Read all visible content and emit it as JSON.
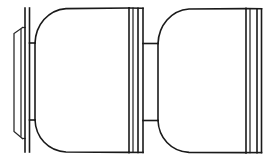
{
  "drawing": {
    "title": "Mechanical Part Outline — Side Elevation",
    "description": "Two-lobe barrel assembly with end flange, necks and banded dividers",
    "canvas": {
      "width": 266,
      "height": 160
    },
    "colors": {
      "background": "#ffffff",
      "outline": "#1a1a1a",
      "secondary_line": "#262626",
      "hairline": "#3a3a3a"
    },
    "line_style": "solid black outline on white, no fill, no shading",
    "view": "side elevation / orthographic profile",
    "components": [
      {
        "id": "end-flange",
        "label": "End Flange",
        "x_range": [
          13,
          24
        ],
        "y_range": [
          33,
          132
        ],
        "note": "thin flared plate at far left, splays outward at top and bottom"
      },
      {
        "id": "flange-web",
        "label": "Flange Web",
        "x_range": [
          24,
          27
        ],
        "y_range": [
          8,
          152
        ],
        "note": "tall narrow vertical rib joining flange to first neck"
      },
      {
        "id": "first-neck",
        "label": "First Neck",
        "x_range": [
          27,
          35
        ],
        "y_range": [
          8,
          152
        ],
        "note": "vertical column, full height"
      },
      {
        "id": "first-hub",
        "label": "First Hub",
        "x_range": [
          27,
          35
        ],
        "y_range": [
          43,
          120
        ],
        "note": "inner hub band bounded by two horizontal tie lines"
      },
      {
        "id": "first-barrel",
        "label": "First Barrel",
        "x_range": [
          35,
          129
        ],
        "y_range": [
          8,
          152
        ],
        "note": "large rounded-corner drum, left corners radiused into the neck"
      },
      {
        "id": "center-band",
        "label": "Center Divider Band",
        "x_range": [
          129,
          143
        ],
        "y_range": [
          8,
          152
        ],
        "note": "narrow banded collar with three parallel vertical rules"
      },
      {
        "id": "second-neck",
        "label": "Second Neck",
        "x_range": [
          143,
          158
        ],
        "y_range": [
          43,
          120
        ],
        "note": "short waisted section between barrels"
      },
      {
        "id": "second-barrel",
        "label": "Second Barrel",
        "x_range": [
          158,
          246
        ],
        "y_range": [
          8,
          152
        ],
        "note": "second rounded-corner drum, mirrors the first"
      },
      {
        "id": "right-band",
        "label": "Right End Band",
        "x_range": [
          246,
          262
        ],
        "y_range": [
          8,
          152
        ],
        "note": "terminal banded collar with parallel vertical rules at image edge"
      }
    ],
    "geometry": {
      "top_edge_y": 8,
      "bottom_edge_y": 152,
      "hub_top_y": 43,
      "hub_bottom_y": 120,
      "corner_radius": 30,
      "flange_left_x": 13,
      "flange_right_x": 24,
      "flange_top_y": 33,
      "flange_bottom_y": 132,
      "flange_flare_top_y": 27,
      "flange_flare_bottom_y": 138,
      "neck1_x": [
        25,
        35
      ],
      "barrel1_x": [
        35,
        129
      ],
      "center_band_rules_x": [
        129,
        133,
        138,
        143
      ],
      "neck2_x": [
        143,
        158
      ],
      "barrel2_x": [
        158,
        246
      ],
      "right_band_rules_x": [
        246,
        250,
        257,
        262
      ]
    }
  }
}
